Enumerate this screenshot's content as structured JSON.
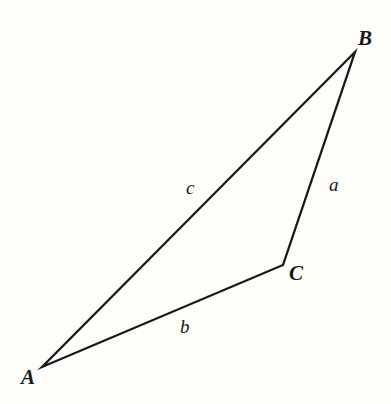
{
  "figure": {
    "kind": "geometry-diagram",
    "background_color": "#fdfdfa",
    "stroke_color": "#18181b",
    "text_color": "#17171a",
    "stroke_width": 2.3,
    "canvas": {
      "width": 391,
      "height": 404
    }
  },
  "vertices": [
    {
      "name": "A",
      "label": "A",
      "x": 42,
      "y": 367
    },
    {
      "name": "B",
      "label": "B",
      "x": 355,
      "y": 52
    },
    {
      "name": "C",
      "label": "C",
      "x": 283,
      "y": 265
    }
  ],
  "sides": [
    {
      "name": "a",
      "label": "a",
      "from": "B",
      "to": "C",
      "label_x": 334,
      "label_y": 184
    },
    {
      "name": "b",
      "label": "b",
      "from": "A",
      "to": "C",
      "label_x": 185,
      "label_y": 326
    },
    {
      "name": "c",
      "label": "c",
      "from": "A",
      "to": "B",
      "label_x": 190,
      "label_y": 187
    }
  ],
  "paths": {
    "outline": "M 42 367 L 355 52 L 283 265 Z"
  }
}
